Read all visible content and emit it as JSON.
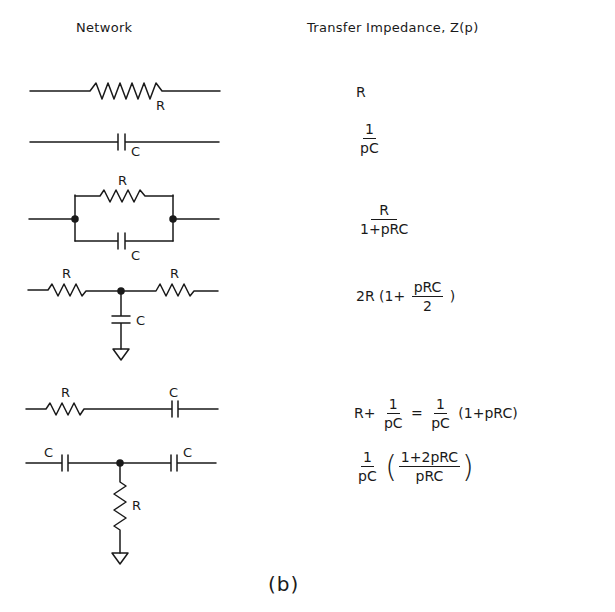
{
  "headers": {
    "network": "Network",
    "impedance": "Transfer Impedance, Z(p)"
  },
  "rows": [
    {
      "network": "series resistor",
      "labels": [
        "R"
      ],
      "impedance": {
        "text": "R"
      }
    },
    {
      "network": "series capacitor",
      "labels": [
        "C"
      ],
      "impedance": {
        "num": "1",
        "den": "pC"
      }
    },
    {
      "network": "parallel R and C",
      "labels": [
        "R",
        "C"
      ],
      "impedance": {
        "num": "R",
        "den": "1+pRC"
      }
    },
    {
      "network": "T network: R series, C shunt to ground, R series",
      "labels": [
        "R",
        "R",
        "C"
      ],
      "impedance": {
        "prefix": "2R (1+",
        "num": "pRC",
        "den": "2",
        "suffix": ")"
      }
    },
    {
      "network": "series R then series C",
      "labels": [
        "R",
        "C"
      ],
      "impedance": {
        "prefix": "R+",
        "num1": "1",
        "den1": "pC",
        "eq": "=",
        "num2": "1",
        "den2": "pC",
        "suffix": "(1+pRC)"
      }
    },
    {
      "network": "T network: C series, R shunt to ground, C series",
      "labels": [
        "C",
        "C",
        "R"
      ],
      "impedance": {
        "num1": "1",
        "den1": "pC",
        "open": "(",
        "num2": "1+2pRC",
        "den2": "pRC",
        "close": ")"
      }
    }
  ],
  "caption": "(b)"
}
